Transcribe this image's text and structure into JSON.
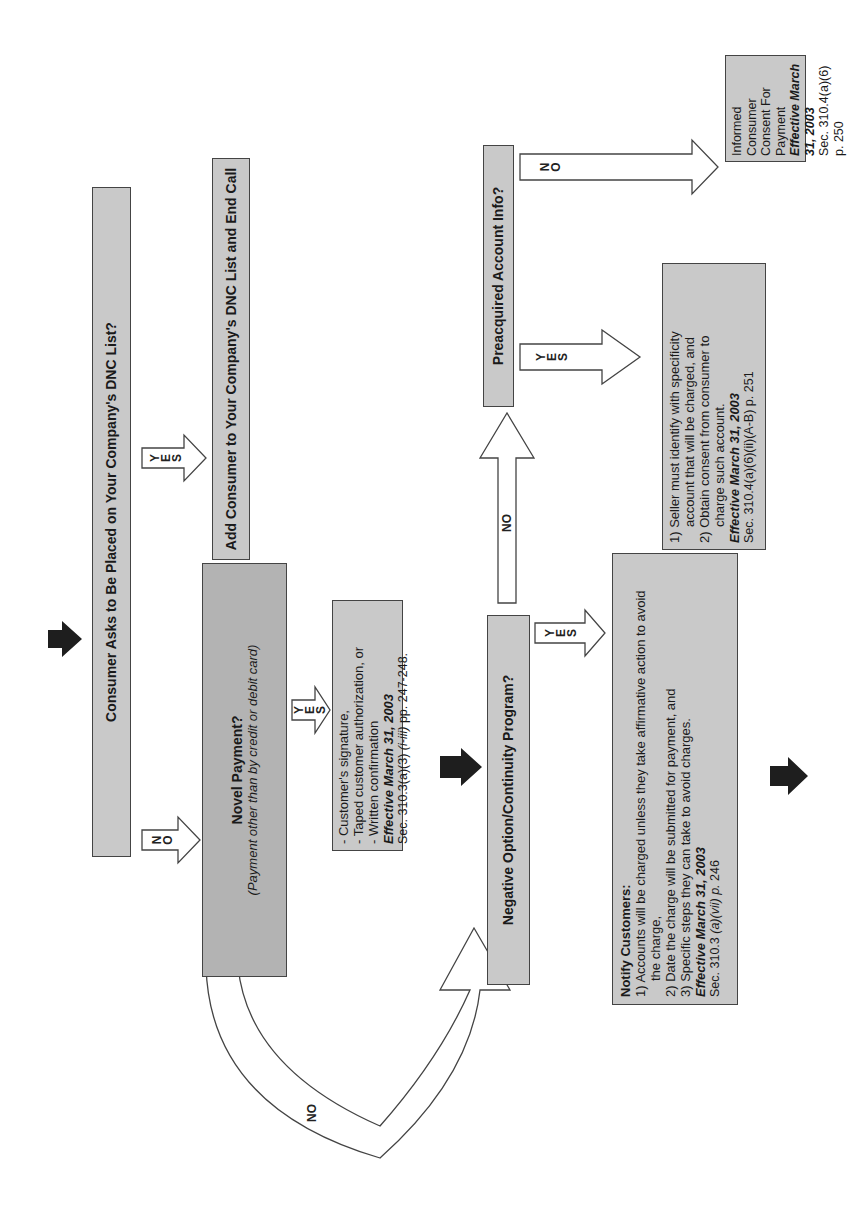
{
  "orientation": "rotated-90-ccw",
  "nodes": {
    "dnc_question": "Consumer Asks to Be Placed on Your Company's DNC List?",
    "add_to_dnc": "Add Consumer to Your Company's DNC List and End Call",
    "novel_payment": {
      "title": "Novel Payment?",
      "subtitle": "(Payment other than by credit or debit card)"
    },
    "novel_yes": {
      "lines": [
        "- Customer's signature,",
        "- Taped customer authorization, or",
        "- Written confirmation"
      ],
      "effective": "Effective March 31, 2003",
      "section_prefix": "Sec. 310.3(a)(3) ",
      "section_italic": "(i-iii)",
      "section_suffix": " pp. 247-248."
    },
    "negative_option": "Negative Option/Continuity Program?",
    "notify": {
      "title": "Notify Customers:",
      "line1": "1) Accounts will be charged unless they take affirmative action to avoid",
      "line1b": "the charge,",
      "line2": "2) Date the charge will be submitted for payment, and",
      "line3": "3) Specific steps they can take to avoid charges.",
      "effective": "Effective March 31, 2003",
      "section_prefix": "Sec. 310.3 ",
      "section_italic": "(a)(vii) p.",
      "section_suffix": " 246"
    },
    "preacquired": "Preacquired Account Info?",
    "preacquired_yes": {
      "line1": "1) Seller must identify with specificity",
      "line1b": "account that will be charged, and",
      "line2": "2) Obtain consent from consumer to",
      "line2b": "charge such account.",
      "effective": "Effective March 31, 2003",
      "section": "Sec. 310.4(a)(6)(ii)(A-B) p. 251"
    },
    "preacquired_no": {
      "line1": "Informed Consumer",
      "line2": "Consent For Payment",
      "effective": "Effective March 31, 2003",
      "section": "Sec. 310.4(a)(6) p. 250"
    }
  },
  "arrow_labels": {
    "yes": [
      "Y",
      "E",
      "S"
    ],
    "no_stacked": [
      "N",
      "O"
    ],
    "no": "NO"
  },
  "colors": {
    "box_fill": "#c9c9c9",
    "box_fill_dark": "#b3b3b3",
    "box_border": "#444444",
    "solid_arrow": "#1e1e1e",
    "background": "#ffffff"
  }
}
